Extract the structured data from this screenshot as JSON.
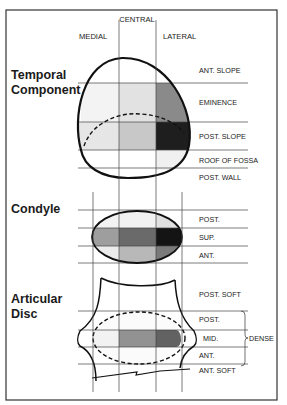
{
  "columns": {
    "central": "CENTRAL",
    "medial": "MEDIAL",
    "lateral": "LATERAL"
  },
  "sections": {
    "temporal": {
      "title_line1": "Temporal",
      "title_line2": "Component",
      "rows": [
        "ANT. SLOPE",
        "EMINENCE",
        "POST. SLOPE",
        "ROOF OF FOSSA",
        "POST. WALL"
      ]
    },
    "condyle": {
      "title": "Condyle",
      "rows": [
        "POST.",
        "SUP.",
        "ANT."
      ]
    },
    "disc": {
      "title_line1": "Articular",
      "title_line2": "Disc",
      "rows": [
        "POST. SOFT",
        "POST.",
        "MID.",
        "ANT.",
        "ANT. SOFT"
      ],
      "bracket_label": "DENSE"
    }
  },
  "shading_colors": {
    "light": "#e6e6e6",
    "medium_light": "#cfcfcf",
    "medium": "#9a9a9a",
    "dark": "#6a6a6a",
    "darkest": "#1e1e1e"
  }
}
